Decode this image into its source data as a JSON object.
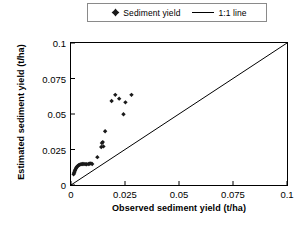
{
  "chart_data": {
    "type": "scatter",
    "title": "",
    "xlabel": "Observed sediment yield (t/ha)",
    "ylabel": "Estimated sediment yield (t/ha)",
    "xlim": [
      0,
      0.1
    ],
    "ylim": [
      0,
      0.1
    ],
    "xticks": [
      "0",
      "0.025",
      "0.05",
      "0.075",
      "0.1"
    ],
    "xtick_values": [
      0,
      0.025,
      0.05,
      0.075,
      0.1
    ],
    "yticks": [
      "0",
      "0.025",
      "0.05",
      "0.075",
      "0.1"
    ],
    "ytick_values": [
      0,
      0.025,
      0.05,
      0.075,
      0.1
    ],
    "grid": false,
    "legend_position": "top-center",
    "series": [
      {
        "name": "Sediment yield",
        "type": "scatter",
        "marker": "diamond",
        "color": "#1a1a1a",
        "points": [
          [
            0.0012,
            0.0075
          ],
          [
            0.0014,
            0.0085
          ],
          [
            0.0016,
            0.0092
          ],
          [
            0.0018,
            0.01
          ],
          [
            0.002,
            0.0108
          ],
          [
            0.0023,
            0.0118
          ],
          [
            0.0026,
            0.0125
          ],
          [
            0.003,
            0.0132
          ],
          [
            0.0034,
            0.0138
          ],
          [
            0.0038,
            0.0142
          ],
          [
            0.0043,
            0.0145
          ],
          [
            0.0048,
            0.0147
          ],
          [
            0.0054,
            0.0148
          ],
          [
            0.006,
            0.0148
          ],
          [
            0.0066,
            0.0147
          ],
          [
            0.0072,
            0.0146
          ],
          [
            0.008,
            0.0148
          ],
          [
            0.0086,
            0.015
          ],
          [
            0.0092,
            0.0152
          ],
          [
            0.0098,
            0.0148
          ],
          [
            0.0122,
            0.0196
          ],
          [
            0.014,
            0.0268
          ],
          [
            0.0143,
            0.0295
          ],
          [
            0.0147,
            0.0302
          ],
          [
            0.015,
            0.0272
          ],
          [
            0.0158,
            0.0378
          ],
          [
            0.0188,
            0.0592
          ],
          [
            0.0205,
            0.0635
          ],
          [
            0.0223,
            0.0608
          ],
          [
            0.0243,
            0.0498
          ],
          [
            0.0252,
            0.0582
          ],
          [
            0.028,
            0.0635
          ]
        ]
      },
      {
        "name": "1:1 line",
        "type": "line",
        "color": "#000000",
        "points": [
          [
            0,
            0
          ],
          [
            0.1,
            0.1
          ]
        ]
      }
    ]
  },
  "legend": {
    "entries": [
      {
        "label": "Sediment yield",
        "icon": "diamond-marker-icon"
      },
      {
        "label": "1:1 line",
        "icon": "line-swatch-icon"
      }
    ]
  },
  "axes": {
    "x_title": "Observed sediment yield (t/ha)",
    "y_title": "Estimated sediment yield (t/ha)",
    "x_tick_labels": [
      "0",
      "0.025",
      "0.05",
      "0.075",
      "0.1"
    ],
    "y_tick_labels": [
      "0",
      "0.025",
      "0.05",
      "0.075",
      "0.1"
    ]
  },
  "colors": {
    "marker": "#1a1a1a",
    "line": "#000000",
    "frame": "#000000",
    "legend_border": "#8a8a8a",
    "background": "#ffffff"
  }
}
